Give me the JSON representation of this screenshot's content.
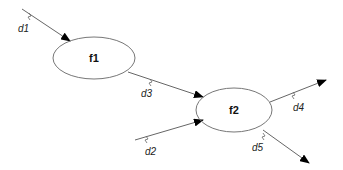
{
  "diagram": {
    "nodes": [
      {
        "id": "f1",
        "label": "f1"
      },
      {
        "id": "f2",
        "label": "f2"
      }
    ],
    "edges": [
      {
        "id": "d1",
        "label": "d1",
        "from": "",
        "to": "f1"
      },
      {
        "id": "d3",
        "label": "d3",
        "from": "f1",
        "to": "f2"
      },
      {
        "id": "d2",
        "label": "d2",
        "from": "",
        "to": "f2"
      },
      {
        "id": "d4",
        "label": "d4",
        "from": "f2",
        "to": ""
      },
      {
        "id": "d5",
        "label": "d5",
        "from": "f2",
        "to": ""
      }
    ],
    "colors": {
      "stroke": "#666666",
      "arrow": "#000000"
    }
  }
}
